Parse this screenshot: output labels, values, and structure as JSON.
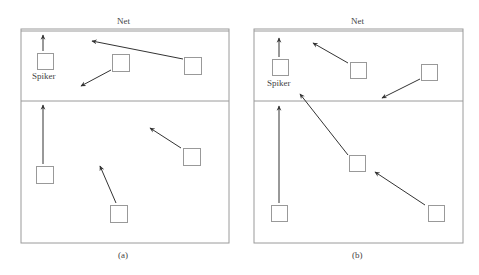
{
  "colors": {
    "court_line": "#9a9a9a",
    "arrow": "#333333",
    "box": "#999999",
    "text": "#444444"
  },
  "panels": [
    {
      "caption": "(a)",
      "net_label": "Net",
      "spiker_label": "Spiker",
      "court": {
        "x": 21,
        "y": 29,
        "w": 208,
        "h": 214,
        "mid_y": 101
      },
      "players": [
        {
          "id": "spiker",
          "x": 37,
          "y": 53,
          "size": 16
        },
        {
          "id": "front-middle",
          "x": 112,
          "y": 54,
          "size": 17
        },
        {
          "id": "front-right",
          "x": 184,
          "y": 57,
          "size": 17
        },
        {
          "id": "back-left",
          "x": 36,
          "y": 166,
          "size": 17
        },
        {
          "id": "back-right",
          "x": 183,
          "y": 148,
          "size": 17
        },
        {
          "id": "back-middle",
          "x": 110,
          "y": 205,
          "size": 17
        }
      ],
      "arrows": [
        {
          "from": [
            43,
            51
          ],
          "to": [
            43,
            35
          ]
        },
        {
          "from": [
            183,
            59
          ],
          "to": [
            92,
            41
          ]
        },
        {
          "from": [
            111,
            70
          ],
          "to": [
            81,
            86
          ]
        },
        {
          "from": [
            43,
            164
          ],
          "to": [
            43,
            105
          ]
        },
        {
          "from": [
            181,
            148
          ],
          "to": [
            150,
            128
          ]
        },
        {
          "from": [
            116,
            203
          ],
          "to": [
            100,
            166
          ]
        }
      ]
    },
    {
      "caption": "(b)",
      "net_label": "Net",
      "spiker_label": "Spiker",
      "court": {
        "x": 254,
        "y": 29,
        "w": 209,
        "h": 214,
        "mid_y": 101
      },
      "players": [
        {
          "id": "spiker",
          "x": 272,
          "y": 59,
          "size": 16
        },
        {
          "id": "front-middle",
          "x": 350,
          "y": 62,
          "size": 16
        },
        {
          "id": "front-right",
          "x": 421,
          "y": 64,
          "size": 16
        },
        {
          "id": "back-middle",
          "x": 349,
          "y": 155,
          "size": 16
        },
        {
          "id": "back-left",
          "x": 271,
          "y": 205,
          "size": 16
        },
        {
          "id": "back-right",
          "x": 428,
          "y": 205,
          "size": 16
        }
      ],
      "arrows": [
        {
          "from": [
            279,
            57
          ],
          "to": [
            279,
            38
          ]
        },
        {
          "from": [
            348,
            63
          ],
          "to": [
            313,
            43
          ]
        },
        {
          "from": [
            420,
            79
          ],
          "to": [
            382,
            98
          ]
        },
        {
          "from": [
            348,
            155
          ],
          "to": [
            300,
            94
          ]
        },
        {
          "from": [
            279,
            203
          ],
          "to": [
            279,
            106
          ]
        },
        {
          "from": [
            425,
            205
          ],
          "to": [
            375,
            172
          ]
        }
      ]
    }
  ]
}
